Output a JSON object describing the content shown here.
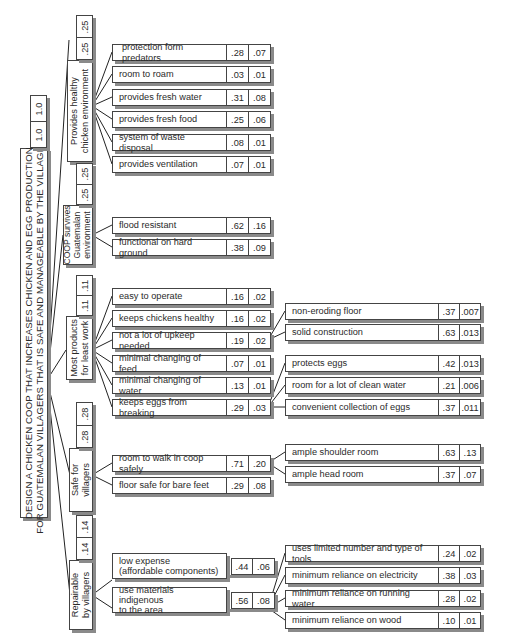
{
  "root": {
    "title_line1": "DESIGN A CHICKEN COOP THAT INCREASES CHICKEN AND EGG PRODUCTION",
    "title_line2": "FOR GUATEMALAN VILLAGERS THAT IS SAFE AND MANAGEABLE BY THE VILLAGERS",
    "local_weight": "1.0",
    "global_weight": "1.0"
  },
  "objectives": [
    {
      "label_line1": "Provides healthy",
      "label_line2": "chicken environment",
      "local_weight": ".25",
      "global_weight": ".25",
      "children": [
        {
          "label": "protection form predators",
          "local": ".28",
          "global": ".07"
        },
        {
          "label": "room to roam",
          "local": ".03",
          "global": ".01"
        },
        {
          "label": "provides fresh water",
          "local": ".31",
          "global": ".08"
        },
        {
          "label": "provides fresh food",
          "local": ".25",
          "global": ".06"
        },
        {
          "label": "system of waste disposal",
          "local": ".08",
          "global": ".01"
        },
        {
          "label": "provides ventilation",
          "local": ".07",
          "global": ".01"
        }
      ]
    },
    {
      "label_line1": "COOP survives",
      "label_line2": "Guatemalan",
      "label_line3": "environment",
      "local_weight": ".25",
      "global_weight": ".25",
      "children": [
        {
          "label": "flood resistant",
          "local": ".62",
          "global": ".16"
        },
        {
          "label": "functional on hard ground",
          "local": ".38",
          "global": ".09"
        }
      ]
    },
    {
      "label_line1": "Most products",
      "label_line2": "for least work",
      "local_weight": ".11",
      "global_weight": ".11",
      "children": [
        {
          "label": "easy to operate",
          "local": ".16",
          "global": ".02"
        },
        {
          "label": "keeps chickens healthy",
          "local": ".16",
          "global": ".02"
        },
        {
          "label": "not a lot of upkeep needed",
          "local": ".19",
          "global": ".02",
          "children": [
            {
              "label": "non-eroding floor",
              "local": ".37",
              "global": ".007"
            },
            {
              "label": "solid construction",
              "local": ".63",
              "global": ".013"
            }
          ]
        },
        {
          "label": "minimal changing of feed",
          "local": ".07",
          "global": ".01"
        },
        {
          "label": "minimal changing of water",
          "local": ".13",
          "global": ".01"
        },
        {
          "label": "keeps eggs from breaking",
          "local": ".29",
          "global": ".03",
          "children": [
            {
              "label": "protects eggs",
              "local": ".42",
              "global": ".013"
            },
            {
              "label": "room for a lot of clean water",
              "local": ".21",
              "global": ".006"
            },
            {
              "label": "convenient collection of eggs",
              "local": ".37",
              "global": ".011"
            }
          ]
        }
      ]
    },
    {
      "label_line1": "Safe for",
      "label_line2": "villagers",
      "local_weight": ".28",
      "global_weight": ".28",
      "children": [
        {
          "label": "room to walk in coop safely",
          "local": ".71",
          "global": ".20",
          "children": [
            {
              "label": "ample shoulder room",
              "local": ".63",
              "global": ".13"
            },
            {
              "label": "ample head room",
              "local": ".37",
              "global": ".07"
            }
          ]
        },
        {
          "label": "floor safe for bare feet",
          "local": ".29",
          "global": ".08"
        }
      ]
    },
    {
      "label_line1": "Repairable",
      "label_line2": "by villagers",
      "local_weight": ".14",
      "global_weight": ".14",
      "children": [
        {
          "label_line1": "low expense",
          "label_line2": "(affordable components)",
          "local": ".44",
          "global": ".06"
        },
        {
          "label_line1": "use materials indigenous",
          "label_line2": "to the area",
          "local": ".56",
          "global": ".08",
          "children": [
            {
              "label": "uses limited number and type of tools",
              "local": ".24",
              "global": ".02"
            },
            {
              "label": "minimum reliance on electricity",
              "local": ".38",
              "global": ".03"
            },
            {
              "label": "minimum reliance on running water",
              "local": ".28",
              "global": ".02"
            },
            {
              "label": "minimum reliance on wood",
              "local": ".10",
              "global": ".01"
            }
          ]
        }
      ]
    }
  ]
}
